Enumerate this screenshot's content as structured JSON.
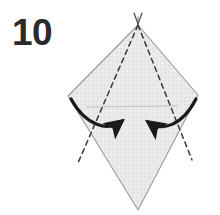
{
  "figure": {
    "step_label": "10",
    "instruction_type": "valley-fold-both-sides-inward",
    "paper": {
      "fill_color": "#e9e9e9",
      "edge_color": "#9a9a9a",
      "texture": "fine-crosshatch"
    },
    "crease_color": "#3a3a3a",
    "arrow_color": "#1a1a1a",
    "guide_line_color": "#b9b9b9",
    "shape_name": "tall-hexagonal-kite",
    "outline_points": "138,25 198,95 138,210 68,96",
    "outline_vertices": [
      {
        "name": "top-apex",
        "x": 138,
        "y": 25
      },
      {
        "name": "right-corner",
        "x": 198,
        "y": 95
      },
      {
        "name": "bottom-tip",
        "x": 138,
        "y": 210
      },
      {
        "name": "left-corner",
        "x": 68,
        "y": 96
      }
    ],
    "creases": [
      {
        "name": "left-crease",
        "x1": 138,
        "y1": 25,
        "x2": 78,
        "y2": 163,
        "style": "dashed"
      },
      {
        "name": "right-crease",
        "x1": 138,
        "y1": 25,
        "x2": 192,
        "y2": 160,
        "style": "dashed"
      }
    ],
    "apex_marks": [
      {
        "name": "apex-tick-left",
        "x1": 134,
        "y1": 14,
        "x2": 138,
        "y2": 24
      },
      {
        "name": "apex-tick-right",
        "x1": 142,
        "y1": 14,
        "x2": 138,
        "y2": 24
      }
    ],
    "guide_line": {
      "name": "horizontal-guide",
      "x1": 86,
      "y1": 107,
      "x2": 178,
      "y2": 106
    },
    "arrows": [
      {
        "name": "left-fold-arrow",
        "direction": "right-inward",
        "path": "M 71,99 C 86,126 108,132 124,121",
        "tip": "124,121"
      },
      {
        "name": "right-fold-arrow",
        "direction": "left-inward",
        "path": "M 196,99 C 182,126 160,132 146,122",
        "tip": "146,122"
      }
    ]
  }
}
